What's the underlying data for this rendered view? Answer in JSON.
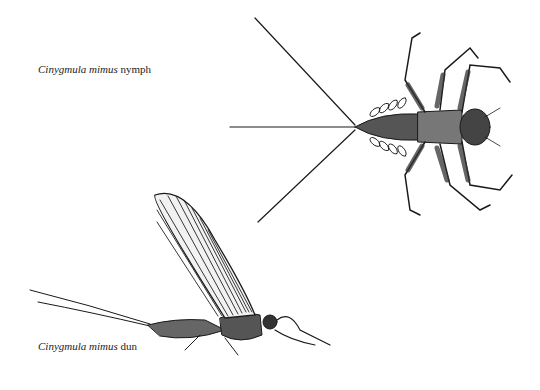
{
  "figure": {
    "captions": [
      {
        "scientific_name": "Cinygmula mimus",
        "stage": "nymph"
      },
      {
        "scientific_name": "Cinygmula mimus",
        "stage": "dun"
      }
    ],
    "illustrations": [
      {
        "subject": "mayfly-nymph",
        "view": "dorsal"
      },
      {
        "subject": "mayfly-dun",
        "view": "lateral"
      }
    ],
    "ink_color": "#1a1a1a",
    "paper_color": "#ffffff"
  }
}
